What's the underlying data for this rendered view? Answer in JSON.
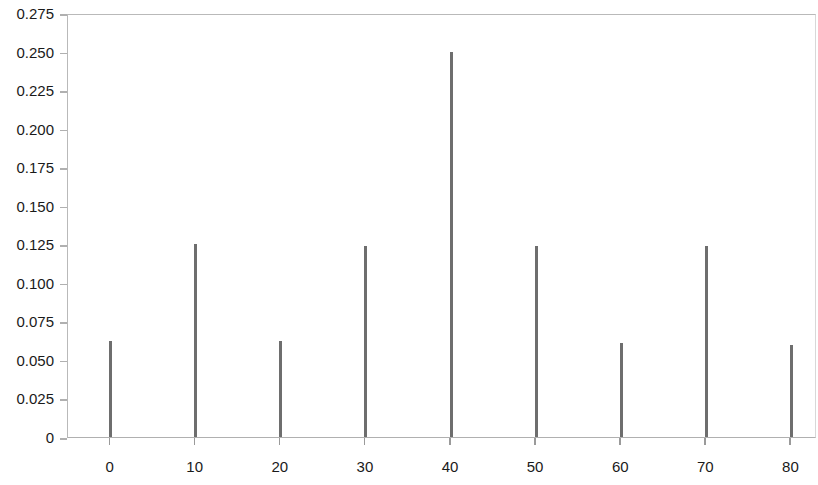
{
  "chart_data": {
    "type": "bar",
    "title": "",
    "subtitle": "",
    "xlabel": "",
    "ylabel": "",
    "categories": [
      "0",
      "10",
      "20",
      "30",
      "40",
      "50",
      "60",
      "70",
      "80"
    ],
    "x": [
      0,
      10,
      20,
      30,
      40,
      50,
      60,
      70,
      80
    ],
    "values": [
      0.062,
      0.125,
      0.062,
      0.124,
      0.25,
      0.124,
      0.061,
      0.124,
      0.06
    ],
    "series": [
      {
        "name": "",
        "values": [
          0.062,
          0.125,
          0.062,
          0.124,
          0.25,
          0.124,
          0.061,
          0.124,
          0.06
        ]
      }
    ],
    "xlim": [
      -5,
      83
    ],
    "ylim": [
      0,
      0.275
    ],
    "ytick_labels": [
      "0.275",
      "0.250",
      "0.225",
      "0.200",
      "0.175",
      "0.150",
      "0.125",
      "0.100",
      "0.075",
      "0.050",
      "0.025",
      "0"
    ],
    "ytick_values": [
      0.275,
      0.25,
      0.225,
      0.2,
      0.175,
      0.15,
      0.125,
      0.1,
      0.075,
      0.05,
      0.025,
      0
    ],
    "xtick_labels": [
      "0",
      "10",
      "20",
      "30",
      "40",
      "50",
      "60",
      "70",
      "80"
    ],
    "xtick_values": [
      0,
      10,
      20,
      30,
      40,
      50,
      60,
      70,
      80
    ],
    "grid": false,
    "legend": false,
    "legend_position": "none",
    "annotations": [],
    "colors": {
      "bar": "#6e6e6e",
      "axis": "#b0b0b0",
      "background": "#ffffff",
      "text": "#1a1a1a"
    }
  }
}
